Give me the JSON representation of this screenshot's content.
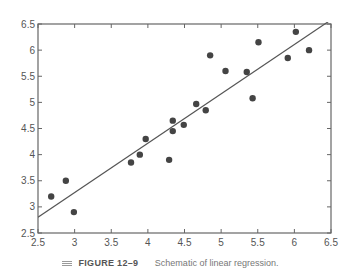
{
  "chart_data": {
    "type": "scatter",
    "title": "",
    "xlabel": "",
    "ylabel": "",
    "xlim": [
      2.5,
      6.5
    ],
    "ylim": [
      2.5,
      6.5
    ],
    "grid": false,
    "x_ticks": [
      "2.5",
      "3",
      "3.5",
      "4",
      "4.5",
      "5",
      "5.5",
      "6",
      "6.5"
    ],
    "y_ticks": [
      "2.5",
      "3",
      "3.5",
      "4",
      "4.5",
      "5",
      "5.5",
      "6",
      "6.5"
    ],
    "series": [
      {
        "name": "observations",
        "points": [
          [
            2.68,
            3.2
          ],
          [
            2.88,
            3.5
          ],
          [
            2.99,
            2.9
          ],
          [
            3.77,
            3.85
          ],
          [
            3.89,
            4.0
          ],
          [
            3.97,
            4.3
          ],
          [
            4.29,
            3.9
          ],
          [
            4.34,
            4.65
          ],
          [
            4.34,
            4.45
          ],
          [
            4.49,
            4.57
          ],
          [
            4.66,
            4.97
          ],
          [
            4.79,
            4.85
          ],
          [
            4.85,
            5.9
          ],
          [
            5.06,
            5.6
          ],
          [
            5.35,
            5.58
          ],
          [
            5.43,
            5.08
          ],
          [
            5.51,
            6.15
          ],
          [
            5.91,
            5.85
          ],
          [
            6.02,
            6.35
          ],
          [
            6.2,
            6.0
          ]
        ]
      }
    ],
    "regression_line": {
      "x": [
        2.5,
        6.5
      ],
      "y": [
        2.8,
        6.58
      ]
    }
  },
  "caption": {
    "figure_label": "FIGURE 12–9",
    "text": "Schematic of linear regression."
  }
}
